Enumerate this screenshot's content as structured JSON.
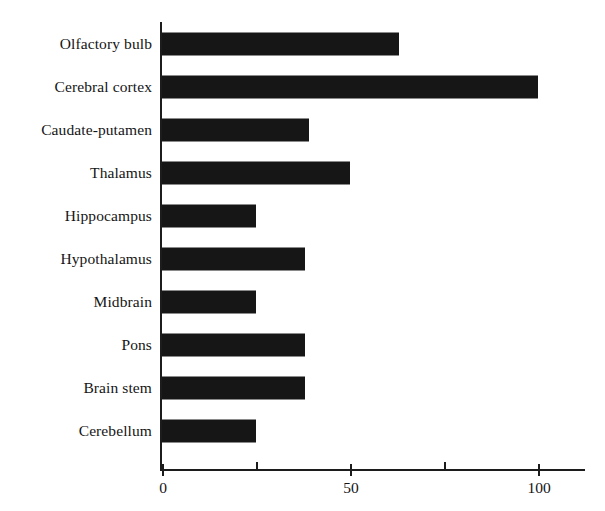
{
  "chart_data": {
    "type": "bar",
    "orientation": "horizontal",
    "title": "",
    "subtitle": "",
    "xlabel": "",
    "ylabel": "",
    "categories": [
      "Olfactory bulb",
      "Cerebral cortex",
      "Caudate-putamen",
      "Thalamus",
      "Hippocampus",
      "Hypothalamus",
      "Midbrain",
      "Pons",
      "Brain stem",
      "Cerebellum"
    ],
    "values": [
      63,
      100,
      39,
      50,
      25,
      38,
      25,
      38,
      38,
      25
    ],
    "series": [
      {
        "name": "",
        "values": [
          63,
          100,
          39,
          50,
          25,
          38,
          25,
          38,
          38,
          25
        ]
      }
    ],
    "xlim": [
      0,
      105
    ],
    "ylim": null,
    "xticks": [
      0,
      50,
      100
    ],
    "xticklabels": [
      "0",
      "50",
      "100"
    ],
    "xminorticks": [
      25,
      75
    ],
    "grid": false,
    "legend": null,
    "legend_position": "none",
    "annotations": [],
    "bar_color": "#161616",
    "axis_color": "#1c1c1c",
    "background_color": "#ffffff"
  }
}
